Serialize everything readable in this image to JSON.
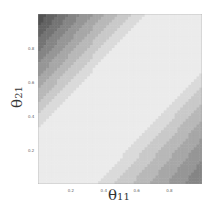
{
  "chart_data": {
    "type": "heatmap",
    "subtype": "filled-contour",
    "title": "",
    "xlabel": "θ11",
    "ylabel": "θ21",
    "xlim": [
      0,
      1
    ],
    "ylim": [
      0,
      1
    ],
    "x_ticks": [
      "0.2",
      "0.4",
      "0.6",
      "0.8"
    ],
    "y_ticks": [
      "0.2",
      "0.4",
      "0.6",
      "0.8"
    ],
    "contour_levels": [
      0.3,
      0.6,
      0.9,
      1.2,
      1.5,
      1.8,
      2.1,
      2.4,
      2.7
    ],
    "colormap": "grayscale (light = low, dark = high)",
    "peaks": [
      {
        "location": "top-left",
        "x": 0.05,
        "y": 0.9,
        "value_approx": 2.8
      },
      {
        "location": "bottom-right",
        "x": 0.9,
        "y": 0.1,
        "value_approx": 2.8
      }
    ],
    "grid": false,
    "legend": "none"
  },
  "labels": {
    "x": "θ",
    "x_sub": "11",
    "y": "θ",
    "y_sub": "21"
  }
}
